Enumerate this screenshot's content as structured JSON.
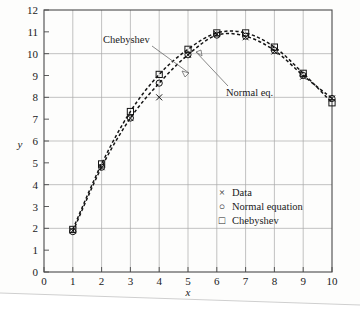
{
  "figure": {
    "kind": "scanned-textbook-plot",
    "background_color": "#fdfdfc",
    "ink_color": "#141414",
    "grid_color": "#a9a9a9"
  },
  "axis": {
    "x_label": "x",
    "y_label": "y",
    "x_ticks": [
      "0",
      "1",
      "2",
      "3",
      "4",
      "5",
      "6",
      "7",
      "8",
      "9",
      "10"
    ],
    "y_ticks": [
      "0",
      "1",
      "2",
      "3",
      "4",
      "5",
      "6",
      "7",
      "8",
      "9",
      "10",
      "11",
      "12"
    ]
  },
  "annotations": [
    {
      "name": "chebyshev-callout",
      "text": "Chebyshev"
    },
    {
      "name": "normal-eq-callout",
      "text": "Normal eq."
    }
  ],
  "legend": {
    "entries": [
      {
        "symbol": "×",
        "label": "Data"
      },
      {
        "symbol": "○",
        "label": "Normal equation"
      },
      {
        "symbol": "□",
        "label": "Chebyshev"
      }
    ]
  },
  "chart_data": {
    "type": "scatter",
    "title": "",
    "xlabel": "x",
    "ylabel": "y",
    "xlim": [
      0,
      10
    ],
    "ylim": [
      0,
      12
    ],
    "grid": true,
    "legend_position": "inside-lower-right",
    "x": [
      1,
      2,
      3,
      4,
      5,
      6,
      7,
      8,
      9,
      10
    ],
    "series": [
      {
        "name": "Data",
        "marker": "×",
        "line": "none",
        "values": [
          1.9,
          4.8,
          7.05,
          8.0,
          9.95,
          10.9,
          10.75,
          10.1,
          8.95,
          7.95
        ]
      },
      {
        "name": "Normal equation",
        "marker": "○",
        "line": "dashed",
        "values": [
          1.85,
          4.8,
          7.05,
          8.65,
          9.95,
          10.85,
          10.8,
          10.15,
          9.0,
          7.95
        ]
      },
      {
        "name": "Chebyshev",
        "marker": "□",
        "line": "dashed",
        "values": [
          1.95,
          4.95,
          7.35,
          9.05,
          10.2,
          10.95,
          10.95,
          10.3,
          9.1,
          7.75
        ]
      }
    ]
  }
}
